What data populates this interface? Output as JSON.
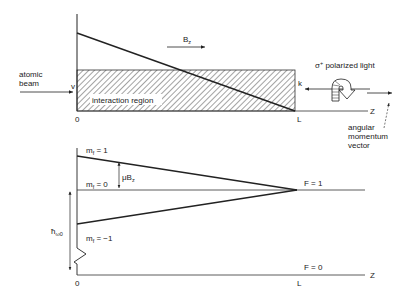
{
  "top_panel": {
    "beam_label_line1": "atomic",
    "beam_label_line2": "beam",
    "velocity_label": "v",
    "region_label": "interaction region",
    "field_label": "B",
    "field_sub": "z",
    "light_label": "σ",
    "light_sup": "+",
    "light_label_rest": " polarized light",
    "k_label": "k",
    "axis_label": "Z",
    "origin_label": "0",
    "end_label": "L",
    "am_line1": "angular",
    "am_line2": "momentum",
    "am_line3": "vector"
  },
  "bottom_panel": {
    "mf_plus": "m",
    "mf_plus_rest": " = 1",
    "mf_zero": "m",
    "mf_zero_rest": " = 0",
    "mf_minus": "m",
    "mf_minus_rest": " = −1",
    "mf_sub": "f",
    "split_label": "μB",
    "split_sub": "z",
    "hbar_label": "ħ",
    "hbar_sub": "ω0",
    "f1_label": "F = 1",
    "f0_label": "F = 0",
    "axis_label": "Z",
    "origin_label": "0",
    "end_label": "L"
  },
  "colors": {
    "ink": "#222222",
    "background": "#ffffff"
  }
}
